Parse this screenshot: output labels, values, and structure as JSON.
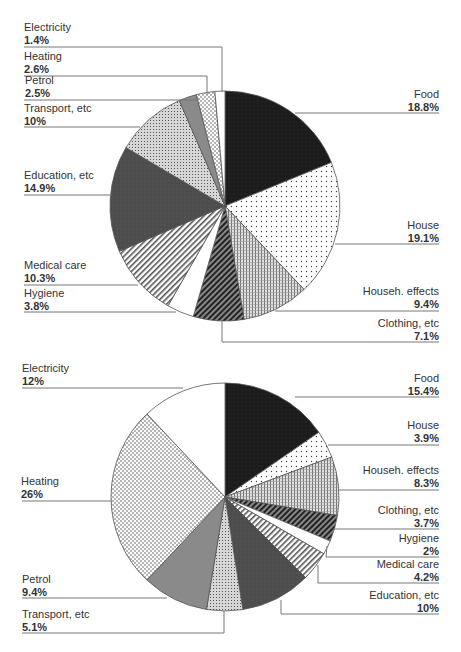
{
  "chart_data": [
    {
      "type": "pie",
      "title": "",
      "start_angle_deg": 0,
      "direction": "clockwise",
      "slices": [
        {
          "label": "Food",
          "value": 18.8,
          "display": "18.8%"
        },
        {
          "label": "House",
          "value": 19.1,
          "display": "19.1%"
        },
        {
          "label": "Househ. effects",
          "value": 9.4,
          "display": "9.4%"
        },
        {
          "label": "Clothing, etc",
          "value": 7.1,
          "display": "7.1%"
        },
        {
          "label": "Hygiene",
          "value": 3.8,
          "display": "3.8%"
        },
        {
          "label": "Medical care",
          "value": 10.3,
          "display": "10.3%"
        },
        {
          "label": "Education, etc",
          "value": 14.9,
          "display": "14.9%"
        },
        {
          "label": "Transport, etc",
          "value": 10,
          "display": "10%"
        },
        {
          "label": "Petrol",
          "value": 2.5,
          "display": "2.5%"
        },
        {
          "label": "Heating",
          "value": 2.6,
          "display": "2.6%"
        },
        {
          "label": "Electricity",
          "value": 1.4,
          "display": "1.4%"
        }
      ]
    },
    {
      "type": "pie",
      "title": "",
      "start_angle_deg": 0,
      "direction": "clockwise",
      "slices": [
        {
          "label": "Food",
          "value": 15.4,
          "display": "15.4%"
        },
        {
          "label": "House",
          "value": 3.9,
          "display": "3.9%"
        },
        {
          "label": "Househ. effects",
          "value": 8.3,
          "display": "8.3%"
        },
        {
          "label": "Clothing, etc",
          "value": 3.7,
          "display": "3.7%"
        },
        {
          "label": "Hygiene",
          "value": 2,
          "display": "2%"
        },
        {
          "label": "Medical care",
          "value": 4.2,
          "display": "4.2%"
        },
        {
          "label": "Education, etc",
          "value": 10,
          "display": "10%"
        },
        {
          "label": "Transport, etc",
          "value": 5.1,
          "display": "5.1%"
        },
        {
          "label": "Petrol",
          "value": 9.4,
          "display": "9.4%"
        },
        {
          "label": "Heating",
          "value": 26,
          "display": "26%"
        },
        {
          "label": "Electricity",
          "value": 12,
          "display": "12%"
        }
      ]
    }
  ],
  "labels": {
    "top": {
      "electricity": {
        "name": "Electricity",
        "val": "1.4%"
      },
      "heating": {
        "name": "Heating",
        "val": "2.6%"
      },
      "petrol": {
        "name": "Petrol",
        "val": "2.5%"
      },
      "transport": {
        "name": "Transport, etc",
        "val": "10%"
      },
      "education": {
        "name": "Education, etc",
        "val": "14.9%"
      },
      "medical": {
        "name": "Medical care",
        "val": "10.3%"
      },
      "hygiene": {
        "name": "Hygiene",
        "val": "3.8%"
      },
      "food": {
        "name": "Food",
        "val": "18.8%"
      },
      "house": {
        "name": "House",
        "val": "19.1%"
      },
      "househ": {
        "name": "Househ. effects",
        "val": "9.4%"
      },
      "clothing": {
        "name": "Clothing, etc",
        "val": "7.1%"
      }
    },
    "bottom": {
      "electricity": {
        "name": "Electricity",
        "val": "12%"
      },
      "heating": {
        "name": "Heating",
        "val": "26%"
      },
      "petrol": {
        "name": "Petrol",
        "val": "9.4%"
      },
      "transport": {
        "name": "Transport, etc",
        "val": "5.1%"
      },
      "food": {
        "name": "Food",
        "val": "15.4%"
      },
      "house": {
        "name": "House",
        "val": "3.9%"
      },
      "househ": {
        "name": "Househ. effects",
        "val": "8.3%"
      },
      "clothing": {
        "name": "Clothing, etc",
        "val": "3.7%"
      },
      "hygiene": {
        "name": "Hygiene",
        "val": "2%"
      },
      "medical": {
        "name": "Medical care",
        "val": "4.2%"
      },
      "education": {
        "name": "Education, etc",
        "val": "10%"
      }
    }
  },
  "colors": {
    "food": "#1a1a1a",
    "education": "#4a4a4a",
    "petrol": "#8a8a8a",
    "leader_line": "#777777",
    "outline": "#555555"
  }
}
